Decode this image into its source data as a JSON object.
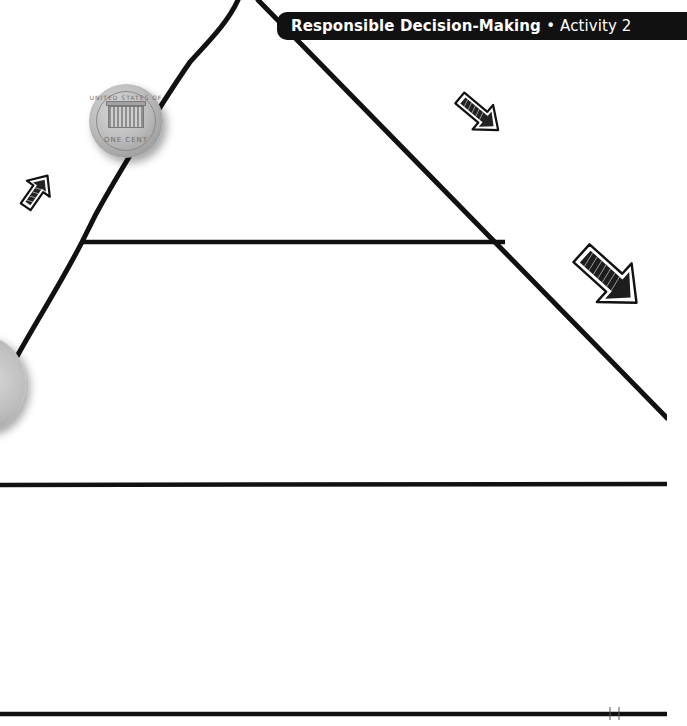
{
  "header": {
    "section": "Responsible Decision-Making",
    "separator": "•",
    "activity": "Activity 2"
  },
  "worksheet": {
    "diagram": "pyramid",
    "pyramid_sections": 2,
    "writing_area_below": true
  },
  "images": {
    "penny": {
      "label": "penny-coin",
      "top_text": "UNITED STATES OF AMERICA",
      "bottom_text": "ONE CENT"
    },
    "quarter": {
      "label": "quarter-coin"
    }
  },
  "arrows": [
    {
      "name": "arrow-up-right",
      "direction": "up-right"
    },
    {
      "name": "arrow-down-right-small",
      "direction": "down-right"
    },
    {
      "name": "arrow-down-right-large",
      "direction": "down-right"
    }
  ],
  "colors": {
    "ink": "#111111",
    "banner_bg": "#111111",
    "banner_text": "#ffffff",
    "page_bg": "#ffffff"
  }
}
